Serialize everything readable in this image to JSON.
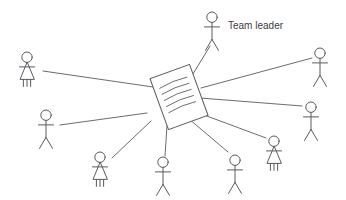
{
  "diagram": {
    "background_color": "#ffffff",
    "line_color": "#6b6b72",
    "figure_color": "#5a5a60",
    "label_color": "#3c3c42",
    "labels": [
      {
        "id": "team-leader",
        "text": "Team leader",
        "x": 228,
        "y": 26
      }
    ],
    "document": {
      "id": "central-document",
      "name": "document",
      "center_x": 179,
      "center_y": 97,
      "width": 42,
      "height": 54,
      "rotation_deg": -20,
      "text_line_count": 5
    },
    "figures": [
      {
        "id": "figure-team-leader",
        "name": "team-leader-figure",
        "gender": "male",
        "x": 212,
        "y": 12,
        "scale": 1.0
      },
      {
        "id": "figure-left-top",
        "name": "member-figure-left-top",
        "gender": "female",
        "x": 27,
        "y": 52,
        "scale": 1.0
      },
      {
        "id": "figure-left-mid",
        "name": "member-figure-left-mid",
        "gender": "male",
        "x": 46,
        "y": 110,
        "scale": 1.0
      },
      {
        "id": "figure-bottom-left",
        "name": "member-figure-bottom-left",
        "gender": "female",
        "x": 100,
        "y": 152,
        "scale": 1.0
      },
      {
        "id": "figure-bottom-center",
        "name": "member-figure-bottom-center",
        "gender": "male",
        "x": 163,
        "y": 157,
        "scale": 1.0
      },
      {
        "id": "figure-bottom-right",
        "name": "member-figure-bottom-right",
        "gender": "male",
        "x": 235,
        "y": 155,
        "scale": 1.0
      },
      {
        "id": "figure-right-low",
        "name": "member-figure-right-low",
        "gender": "female",
        "x": 274,
        "y": 136,
        "scale": 1.0
      },
      {
        "id": "figure-right-mid",
        "name": "member-figure-right-mid",
        "gender": "male",
        "x": 311,
        "y": 102,
        "scale": 1.0
      },
      {
        "id": "figure-right-top",
        "name": "member-figure-right-top",
        "gender": "male",
        "x": 320,
        "y": 48,
        "scale": 1.0
      }
    ],
    "connections": [
      {
        "id": "conn-team-leader",
        "from": "central-document",
        "to": "figure-team-leader",
        "x1": 193,
        "y1": 74,
        "x2": 210,
        "y2": 46
      },
      {
        "id": "conn-left-top",
        "from": "figure-left-top",
        "to": "central-document",
        "x1": 43,
        "y1": 71,
        "x2": 153,
        "y2": 87
      },
      {
        "id": "conn-left-mid",
        "from": "figure-left-mid",
        "to": "central-document",
        "x1": 60,
        "y1": 125,
        "x2": 147,
        "y2": 113
      },
      {
        "id": "conn-bottom-left",
        "from": "figure-bottom-left",
        "to": "central-document",
        "x1": 112,
        "y1": 158,
        "x2": 151,
        "y2": 121
      },
      {
        "id": "conn-bottom-center",
        "from": "figure-bottom-center",
        "to": "central-document",
        "x1": 165,
        "y1": 156,
        "x2": 167,
        "y2": 126
      },
      {
        "id": "conn-bottom-right",
        "from": "figure-bottom-right",
        "to": "central-document",
        "x1": 228,
        "y1": 152,
        "x2": 189,
        "y2": 119
      },
      {
        "id": "conn-right-low",
        "from": "figure-right-low",
        "to": "central-document",
        "x1": 266,
        "y1": 138,
        "x2": 196,
        "y2": 112
      },
      {
        "id": "conn-right-mid",
        "from": "figure-right-mid",
        "to": "central-document",
        "x1": 302,
        "y1": 106,
        "x2": 200,
        "y2": 98
      },
      {
        "id": "conn-right-top",
        "from": "figure-right-top",
        "to": "central-document",
        "x1": 312,
        "y1": 58,
        "x2": 201,
        "y2": 88
      }
    ]
  }
}
